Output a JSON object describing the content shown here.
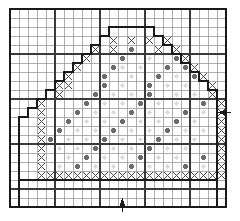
{
  "chart_data": {
    "type": "heatmap",
    "title": "",
    "grid": {
      "columns": 24,
      "rows": 22,
      "cell_px": 9,
      "origin_x": 10,
      "origin_y": 9,
      "minor_line_color": "#9a9a9a",
      "major_line_color": "#3a3a3a",
      "major_every": 5,
      "border_color": "#1a1a1a",
      "background": "#ffffff"
    },
    "legend": [
      {
        "key": "x",
        "symbol": "X",
        "label": "cross-stitch",
        "color": "#4a4a4a"
      },
      {
        "key": "dot_dark",
        "symbol": "●",
        "label": "dark-dot",
        "color": "#6b6b6b"
      },
      {
        "key": "dot_faint",
        "symbol": "●",
        "label": "faint-dot",
        "color": "#dcdcdc"
      }
    ],
    "outline": {
      "name": "dome-outline",
      "color": "#1a1a1a",
      "width_px": 2,
      "points": [
        [
          1,
          19
        ],
        [
          1,
          12
        ],
        [
          2,
          12
        ],
        [
          2,
          11
        ],
        [
          3,
          11
        ],
        [
          3,
          10
        ],
        [
          4,
          10
        ],
        [
          4,
          9
        ],
        [
          5,
          9
        ],
        [
          5,
          8
        ],
        [
          6,
          8
        ],
        [
          6,
          7
        ],
        [
          7,
          7
        ],
        [
          7,
          6
        ],
        [
          8,
          6
        ],
        [
          8,
          5
        ],
        [
          9,
          5
        ],
        [
          9,
          4
        ],
        [
          10,
          4
        ],
        [
          10,
          3
        ],
        [
          11,
          3
        ],
        [
          11,
          2
        ],
        [
          16,
          2
        ],
        [
          16,
          3
        ],
        [
          17,
          3
        ],
        [
          17,
          4
        ],
        [
          18,
          4
        ],
        [
          18,
          5
        ],
        [
          19,
          5
        ],
        [
          19,
          6
        ],
        [
          20,
          6
        ],
        [
          20,
          7
        ],
        [
          21,
          7
        ],
        [
          21,
          8
        ],
        [
          22,
          8
        ],
        [
          22,
          9
        ],
        [
          23,
          9
        ],
        [
          23,
          19
        ],
        [
          1,
          19
        ]
      ]
    },
    "inner_frame": {
      "name": "inner-frame",
      "color": "#1a1a1a",
      "width_px": 1.5,
      "rect_cells": [
        1,
        19,
        22,
        3
      ]
    },
    "x_cells": [
      [
        12,
        4
      ],
      [
        14,
        4
      ],
      [
        16,
        4
      ],
      [
        18,
        4
      ],
      [
        10,
        5
      ],
      [
        12,
        5
      ],
      [
        17,
        5
      ],
      [
        19,
        5
      ],
      [
        9,
        6
      ],
      [
        20,
        6
      ],
      [
        8,
        7
      ],
      [
        21,
        7
      ],
      [
        7,
        8
      ],
      [
        22,
        8
      ],
      [
        6,
        9
      ],
      [
        7,
        9
      ],
      [
        23,
        9
      ],
      [
        6,
        10
      ],
      [
        23,
        10
      ],
      [
        4,
        11
      ],
      [
        24,
        11
      ],
      [
        4,
        12
      ],
      [
        24,
        12
      ],
      [
        4,
        13
      ],
      [
        24,
        13
      ],
      [
        4,
        14
      ],
      [
        24,
        14
      ],
      [
        4,
        15
      ],
      [
        24,
        15
      ],
      [
        4,
        16
      ],
      [
        24,
        16
      ],
      [
        4,
        17
      ],
      [
        24,
        17
      ],
      [
        4,
        18
      ],
      [
        24,
        18
      ],
      [
        4,
        19
      ],
      [
        5,
        19
      ],
      [
        6,
        19
      ],
      [
        7,
        19
      ],
      [
        8,
        19
      ],
      [
        9,
        19
      ],
      [
        10,
        19
      ],
      [
        11,
        19
      ],
      [
        12,
        19
      ],
      [
        13,
        19
      ],
      [
        14,
        19
      ],
      [
        15,
        19
      ],
      [
        16,
        19
      ],
      [
        17,
        19
      ],
      [
        18,
        19
      ],
      [
        19,
        19
      ],
      [
        20,
        19
      ],
      [
        21,
        19
      ],
      [
        22,
        19
      ],
      [
        23,
        19
      ],
      [
        24,
        19
      ]
    ],
    "dot_dark_cells": [
      [
        14,
        5
      ],
      [
        13,
        6
      ],
      [
        19,
        6
      ],
      [
        12,
        7
      ],
      [
        18,
        7
      ],
      [
        20,
        7
      ],
      [
        11,
        8
      ],
      [
        17,
        8
      ],
      [
        21,
        8
      ],
      [
        11,
        9
      ],
      [
        16,
        9
      ],
      [
        10,
        10
      ],
      [
        16,
        10
      ],
      [
        9,
        11
      ],
      [
        15,
        11
      ],
      [
        22,
        11
      ],
      [
        8,
        12
      ],
      [
        14,
        12
      ],
      [
        20,
        12
      ],
      [
        7,
        13
      ],
      [
        13,
        13
      ],
      [
        19,
        13
      ],
      [
        6,
        14
      ],
      [
        12,
        14
      ],
      [
        18,
        14
      ],
      [
        5,
        15
      ],
      [
        11,
        15
      ],
      [
        17,
        15
      ],
      [
        10,
        16
      ],
      [
        16,
        16
      ],
      [
        9,
        17
      ],
      [
        15,
        17
      ],
      [
        22,
        17
      ],
      [
        8,
        18
      ],
      [
        14,
        18
      ],
      [
        20,
        18
      ]
    ],
    "dot_faint_cells": [
      [
        16,
        6
      ],
      [
        13,
        7
      ],
      [
        15,
        7
      ],
      [
        14,
        8
      ],
      [
        19,
        8
      ],
      [
        20,
        9
      ],
      [
        13,
        9
      ],
      [
        18,
        9
      ],
      [
        12,
        10
      ],
      [
        14,
        10
      ],
      [
        19,
        10
      ],
      [
        21,
        10
      ],
      [
        11,
        11
      ],
      [
        13,
        11
      ],
      [
        17,
        11
      ],
      [
        19,
        11
      ],
      [
        10,
        12
      ],
      [
        12,
        12
      ],
      [
        16,
        12
      ],
      [
        18,
        12
      ],
      [
        22,
        12
      ],
      [
        9,
        13
      ],
      [
        11,
        13
      ],
      [
        15,
        13
      ],
      [
        17,
        13
      ],
      [
        21,
        13
      ],
      [
        8,
        14
      ],
      [
        10,
        14
      ],
      [
        14,
        14
      ],
      [
        16,
        14
      ],
      [
        20,
        14
      ],
      [
        22,
        14
      ],
      [
        7,
        15
      ],
      [
        9,
        15
      ],
      [
        13,
        15
      ],
      [
        15,
        15
      ],
      [
        19,
        15
      ],
      [
        21,
        15
      ],
      [
        6,
        16
      ],
      [
        8,
        16
      ],
      [
        12,
        16
      ],
      [
        14,
        16
      ],
      [
        18,
        16
      ],
      [
        20,
        16
      ],
      [
        7,
        17
      ],
      [
        11,
        17
      ],
      [
        13,
        17
      ],
      [
        17,
        17
      ],
      [
        19,
        17
      ],
      [
        6,
        18
      ],
      [
        10,
        18
      ],
      [
        12,
        18
      ],
      [
        16,
        18
      ],
      [
        18,
        18
      ],
      [
        22,
        18
      ]
    ],
    "markers": [
      {
        "name": "bottom-start-arrow",
        "direction": "up",
        "cell_x": 13,
        "cell_y": 22,
        "color": "#1a1a1a"
      },
      {
        "name": "right-row-arrow",
        "direction": "left",
        "cell_x": 24,
        "cell_y": 12,
        "color": "#1a1a1a"
      }
    ]
  }
}
